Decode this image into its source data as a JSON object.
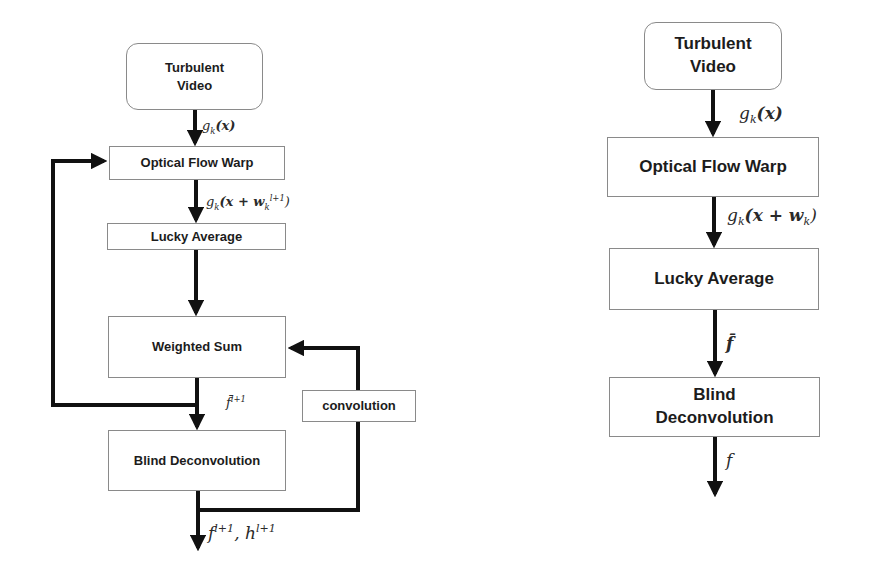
{
  "left_diagram": {
    "nodes": {
      "turbulent_video": "Turbulent\nVideo",
      "optical_flow_warp": "Optical Flow Warp",
      "lucky_average": "Lucky Average",
      "weighted_sum": "Weighted Sum",
      "convolution": "convolution",
      "blind_deconvolution": "Blind Deconvolution"
    },
    "edge_labels": {
      "video_to_warp": {
        "base": "g",
        "sub": "k",
        "rest": "(x)"
      },
      "warp_to_lucky": {
        "base": "g",
        "sub": "k",
        "rest_open": "(x + w",
        "w_sub": "k",
        "w_sup": "l+1",
        "close": ")"
      },
      "weighted_to_blind": {
        "base": "f̄",
        "sup": "l+1"
      },
      "output": {
        "f": "f",
        "f_sup": "l+1",
        "sep": ", ",
        "h": "h",
        "h_sup": "l+1"
      }
    }
  },
  "right_diagram": {
    "nodes": {
      "turbulent_video": "Turbulent\nVideo",
      "optical_flow_warp": "Optical Flow Warp",
      "lucky_average": "Lucky Average",
      "blind_deconvolution": "Blind\nDeconvolution"
    },
    "edge_labels": {
      "video_to_warp": {
        "base": "g",
        "sub": "k",
        "rest": "(x)"
      },
      "warp_to_lucky": {
        "base": "g",
        "sub": "k",
        "rest_open": "(x + w",
        "w_sub": "k",
        "close": ")"
      },
      "lucky_to_blind": "f̄",
      "output": "f"
    }
  },
  "colors": {
    "arrow": "#111111",
    "box_border": "#8a8a8a",
    "text": "#1c1c1c"
  }
}
